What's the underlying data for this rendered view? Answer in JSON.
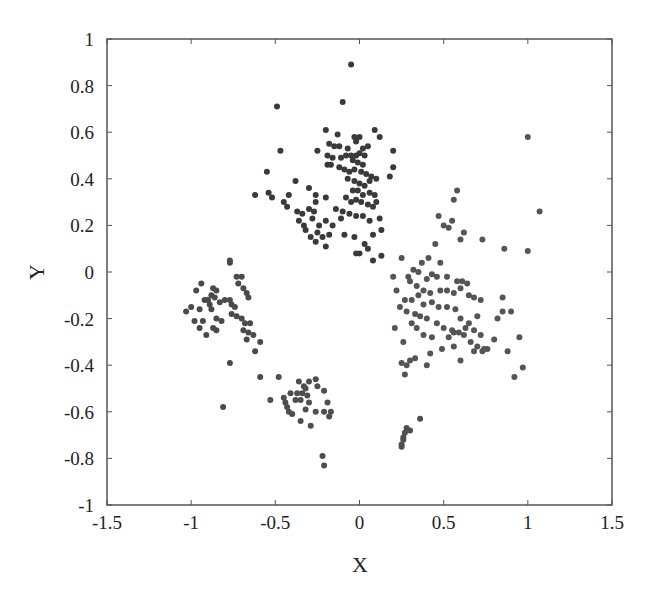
{
  "chart_data": {
    "type": "scatter",
    "title": "",
    "xlabel": "X",
    "ylabel": "Y",
    "xlim": [
      -1.5,
      1.5
    ],
    "ylim": [
      -1,
      1
    ],
    "xticks": [
      -1.5,
      -1,
      -0.5,
      0,
      0.5,
      1,
      1.5
    ],
    "xtick_labels": [
      "-1.5",
      "-1",
      "-0.5",
      "0",
      "0.5",
      "1",
      "1.5"
    ],
    "yticks": [
      -1,
      -0.8,
      -0.6,
      -0.4,
      -0.2,
      0,
      0.2,
      0.4,
      0.6,
      0.8,
      1
    ],
    "ytick_labels": [
      "-1",
      "-0.8",
      "-0.6",
      "-0.4",
      "-0.2",
      "0",
      "0.2",
      "0.4",
      "0.6",
      "0.8",
      "1"
    ],
    "grid": false,
    "legend": null,
    "marker_color": "#444444",
    "marker_color_light": "#5a5a5a",
    "marker_radius": 3,
    "series": [
      {
        "name": "cluster-top",
        "color": "#3a3a3a",
        "points": [
          [
            -0.05,
            0.89
          ],
          [
            -0.1,
            0.73
          ],
          [
            -0.49,
            0.71
          ],
          [
            -0.2,
            0.61
          ],
          [
            -0.13,
            0.59
          ],
          [
            -0.03,
            0.58
          ],
          [
            0.0,
            0.58
          ],
          [
            -0.02,
            0.56
          ],
          [
            0.09,
            0.61
          ],
          [
            0.12,
            0.58
          ],
          [
            -0.47,
            0.52
          ],
          [
            -0.25,
            0.52
          ],
          [
            0.02,
            0.53
          ],
          [
            0.05,
            0.54
          ],
          [
            -0.18,
            0.55
          ],
          [
            -0.15,
            0.54
          ],
          [
            -0.12,
            0.54
          ],
          [
            -0.07,
            0.53
          ],
          [
            -0.19,
            0.5
          ],
          [
            -0.16,
            0.49
          ],
          [
            -0.11,
            0.49
          ],
          [
            -0.08,
            0.5
          ],
          [
            -0.05,
            0.5
          ],
          [
            -0.02,
            0.5
          ],
          [
            0.0,
            0.51
          ],
          [
            0.03,
            0.5
          ],
          [
            -0.04,
            0.48
          ],
          [
            -0.01,
            0.47
          ],
          [
            0.02,
            0.46
          ],
          [
            -0.19,
            0.46
          ],
          [
            -0.17,
            0.46
          ],
          [
            -0.12,
            0.45
          ],
          [
            -0.09,
            0.44
          ],
          [
            -0.06,
            0.43
          ],
          [
            -0.03,
            0.44
          ],
          [
            0.01,
            0.43
          ],
          [
            0.04,
            0.42
          ],
          [
            0.07,
            0.41
          ],
          [
            -0.07,
            0.4
          ],
          [
            -0.03,
            0.39
          ],
          [
            0.0,
            0.38
          ],
          [
            0.03,
            0.37
          ],
          [
            0.06,
            0.39
          ],
          [
            0.1,
            0.4
          ],
          [
            -0.55,
            0.43
          ],
          [
            -0.38,
            0.39
          ],
          [
            -0.3,
            0.36
          ],
          [
            -0.04,
            0.35
          ],
          [
            -0.01,
            0.35
          ],
          [
            0.02,
            0.33
          ],
          [
            0.06,
            0.34
          ],
          [
            0.09,
            0.33
          ],
          [
            -0.08,
            0.32
          ],
          [
            -0.05,
            0.3
          ],
          [
            -0.02,
            0.31
          ],
          [
            0.01,
            0.3
          ],
          [
            0.05,
            0.29
          ],
          [
            0.08,
            0.28
          ],
          [
            -0.2,
            0.32
          ],
          [
            -0.26,
            0.33
          ],
          [
            0.1,
            0.3
          ],
          [
            -0.14,
            0.27
          ],
          [
            -0.1,
            0.26
          ],
          [
            -0.06,
            0.25
          ],
          [
            -0.02,
            0.24
          ],
          [
            0.02,
            0.24
          ],
          [
            0.06,
            0.22
          ],
          [
            -0.62,
            0.33
          ],
          [
            -0.54,
            0.34
          ],
          [
            -0.52,
            0.32
          ],
          [
            -0.45,
            0.3
          ],
          [
            -0.43,
            0.28
          ],
          [
            -0.37,
            0.26
          ],
          [
            -0.34,
            0.25
          ],
          [
            -0.3,
            0.27
          ],
          [
            -0.26,
            0.3
          ],
          [
            -0.27,
            0.26
          ],
          [
            -0.42,
            0.33
          ],
          [
            -0.36,
            0.22
          ],
          [
            -0.33,
            0.2
          ],
          [
            -0.28,
            0.23
          ],
          [
            -0.24,
            0.2
          ],
          [
            -0.2,
            0.22
          ],
          [
            -0.16,
            0.2
          ],
          [
            -0.32,
            0.18
          ],
          [
            -0.29,
            0.15
          ],
          [
            -0.25,
            0.17
          ],
          [
            -0.22,
            0.15
          ],
          [
            -0.18,
            0.16
          ],
          [
            -0.26,
            0.13
          ],
          [
            -0.2,
            0.11
          ],
          [
            -0.09,
            0.16
          ],
          [
            -0.03,
            0.15
          ],
          [
            0.03,
            0.12
          ],
          [
            0.0,
            0.08
          ],
          [
            0.08,
            0.16
          ],
          [
            -0.11,
            0.23
          ],
          [
            0.12,
            0.23
          ],
          [
            0.13,
            0.18
          ],
          [
            0.2,
            0.52
          ],
          [
            0.2,
            0.45
          ],
          [
            0.18,
            0.41
          ],
          [
            -0.02,
            0.08
          ],
          [
            0.05,
            0.1
          ],
          [
            0.08,
            0.05
          ],
          [
            0.13,
            0.07
          ]
        ]
      },
      {
        "name": "cluster-right",
        "color": "#555555",
        "points": [
          [
            1.0,
            0.58
          ],
          [
            1.07,
            0.26
          ],
          [
            0.58,
            0.35
          ],
          [
            0.56,
            0.31
          ],
          [
            0.47,
            0.24
          ],
          [
            0.55,
            0.22
          ],
          [
            0.5,
            0.2
          ],
          [
            0.53,
            0.19
          ],
          [
            0.62,
            0.17
          ],
          [
            0.6,
            0.14
          ],
          [
            0.73,
            0.14
          ],
          [
            0.86,
            0.1
          ],
          [
            1.0,
            0.09
          ],
          [
            0.45,
            0.12
          ],
          [
            0.41,
            0.06
          ],
          [
            0.25,
            0.06
          ],
          [
            0.37,
            0.04
          ],
          [
            0.48,
            0.04
          ],
          [
            0.2,
            -0.02
          ],
          [
            0.35,
            0.0
          ],
          [
            0.29,
            -0.02
          ],
          [
            0.4,
            -0.03
          ],
          [
            0.43,
            -0.01
          ],
          [
            0.46,
            -0.02
          ],
          [
            0.52,
            -0.02
          ],
          [
            0.58,
            -0.04
          ],
          [
            0.61,
            -0.04
          ],
          [
            0.64,
            -0.05
          ],
          [
            0.3,
            -0.04
          ],
          [
            0.34,
            -0.06
          ],
          [
            0.38,
            -0.08
          ],
          [
            0.42,
            -0.09
          ],
          [
            0.48,
            -0.08
          ],
          [
            0.52,
            -0.08
          ],
          [
            0.56,
            -0.09
          ],
          [
            0.6,
            -0.07
          ],
          [
            0.65,
            -0.1
          ],
          [
            0.68,
            -0.11
          ],
          [
            0.72,
            -0.12
          ],
          [
            0.85,
            -0.11
          ],
          [
            0.9,
            -0.17
          ],
          [
            0.27,
            -0.12
          ],
          [
            0.31,
            -0.12
          ],
          [
            0.35,
            -0.1
          ],
          [
            0.38,
            -0.14
          ],
          [
            0.43,
            -0.13
          ],
          [
            0.47,
            -0.15
          ],
          [
            0.52,
            -0.15
          ],
          [
            0.57,
            -0.16
          ],
          [
            0.6,
            -0.2
          ],
          [
            0.65,
            -0.22
          ],
          [
            0.7,
            -0.19
          ],
          [
            0.82,
            -0.2
          ],
          [
            0.85,
            -0.17
          ],
          [
            0.28,
            -0.17
          ],
          [
            0.33,
            -0.18
          ],
          [
            0.36,
            -0.19
          ],
          [
            0.4,
            -0.2
          ],
          [
            0.46,
            -0.22
          ],
          [
            0.5,
            -0.24
          ],
          [
            0.55,
            -0.25
          ],
          [
            0.59,
            -0.26
          ],
          [
            0.63,
            -0.24
          ],
          [
            0.68,
            -0.25
          ],
          [
            0.72,
            -0.27
          ],
          [
            0.8,
            -0.29
          ],
          [
            0.31,
            -0.22
          ],
          [
            0.34,
            -0.24
          ],
          [
            0.38,
            -0.27
          ],
          [
            0.43,
            -0.28
          ],
          [
            0.53,
            -0.28
          ],
          [
            0.56,
            -0.26
          ],
          [
            0.62,
            -0.27
          ],
          [
            0.66,
            -0.3
          ],
          [
            0.7,
            -0.32
          ],
          [
            0.74,
            -0.33
          ],
          [
            0.88,
            -0.34
          ],
          [
            0.95,
            -0.28
          ],
          [
            0.3,
            -0.38
          ],
          [
            0.33,
            -0.37
          ],
          [
            0.42,
            -0.35
          ],
          [
            0.49,
            -0.33
          ],
          [
            0.56,
            -0.32
          ],
          [
            0.68,
            -0.34
          ],
          [
            0.73,
            -0.34
          ],
          [
            0.76,
            -0.33
          ],
          [
            0.25,
            -0.39
          ],
          [
            0.28,
            -0.4
          ],
          [
            0.27,
            -0.44
          ],
          [
            0.4,
            -0.4
          ],
          [
            0.6,
            -0.38
          ],
          [
            0.97,
            -0.41
          ],
          [
            0.92,
            -0.45
          ],
          [
            0.22,
            -0.08
          ],
          [
            0.24,
            -0.15
          ],
          [
            0.21,
            -0.24
          ],
          [
            0.26,
            -0.3
          ],
          [
            0.32,
            0.01
          ]
        ]
      },
      {
        "name": "cluster-left",
        "color": "#4a4a4a",
        "points": [
          [
            -0.77,
            0.05
          ],
          [
            -0.77,
            0.04
          ],
          [
            -0.73,
            -0.02
          ],
          [
            -0.7,
            -0.02
          ],
          [
            -0.94,
            -0.05
          ],
          [
            -0.97,
            -0.08
          ],
          [
            -0.87,
            -0.07
          ],
          [
            -0.85,
            -0.08
          ],
          [
            -0.88,
            -0.1
          ],
          [
            -0.72,
            -0.05
          ],
          [
            -0.69,
            -0.07
          ],
          [
            -0.67,
            -0.09
          ],
          [
            -0.66,
            -0.11
          ],
          [
            -0.9,
            -0.12
          ],
          [
            -0.92,
            -0.12
          ],
          [
            -0.89,
            -0.14
          ],
          [
            -0.86,
            -0.11
          ],
          [
            -0.83,
            -0.13
          ],
          [
            -0.8,
            -0.12
          ],
          [
            -0.77,
            -0.12
          ],
          [
            -1.0,
            -0.15
          ],
          [
            -0.95,
            -0.16
          ],
          [
            -0.88,
            -0.16
          ],
          [
            -0.76,
            -0.14
          ],
          [
            -0.74,
            -0.15
          ],
          [
            -1.03,
            -0.17
          ],
          [
            -0.76,
            -0.18
          ],
          [
            -0.73,
            -0.19
          ],
          [
            -0.7,
            -0.2
          ],
          [
            -0.98,
            -0.21
          ],
          [
            -0.93,
            -0.21
          ],
          [
            -0.85,
            -0.2
          ],
          [
            -0.82,
            -0.21
          ],
          [
            -0.68,
            -0.22
          ],
          [
            -0.65,
            -0.22
          ],
          [
            -0.95,
            -0.24
          ],
          [
            -0.87,
            -0.24
          ],
          [
            -0.85,
            -0.25
          ],
          [
            -0.69,
            -0.25
          ],
          [
            -0.66,
            -0.26
          ],
          [
            -0.63,
            -0.27
          ],
          [
            -0.91,
            -0.27
          ],
          [
            -0.67,
            -0.29
          ],
          [
            -0.59,
            -0.3
          ],
          [
            -0.62,
            -0.34
          ],
          [
            -0.77,
            -0.39
          ],
          [
            -0.59,
            -0.45
          ],
          [
            -0.81,
            -0.58
          ]
        ]
      },
      {
        "name": "cluster-bottom",
        "color": "#4e4e4e",
        "points": [
          [
            -0.48,
            -0.45
          ],
          [
            -0.36,
            -0.47
          ],
          [
            -0.3,
            -0.47
          ],
          [
            -0.26,
            -0.46
          ],
          [
            -0.33,
            -0.49
          ],
          [
            -0.32,
            -0.5
          ],
          [
            -0.25,
            -0.49
          ],
          [
            -0.41,
            -0.52
          ],
          [
            -0.37,
            -0.52
          ],
          [
            -0.34,
            -0.52
          ],
          [
            -0.31,
            -0.53
          ],
          [
            -0.21,
            -0.51
          ],
          [
            -0.53,
            -0.55
          ],
          [
            -0.45,
            -0.54
          ],
          [
            -0.44,
            -0.56
          ],
          [
            -0.38,
            -0.55
          ],
          [
            -0.35,
            -0.55
          ],
          [
            -0.3,
            -0.56
          ],
          [
            -0.19,
            -0.56
          ],
          [
            -0.43,
            -0.58
          ],
          [
            -0.42,
            -0.6
          ],
          [
            -0.32,
            -0.59
          ],
          [
            -0.26,
            -0.6
          ],
          [
            -0.21,
            -0.6
          ],
          [
            -0.17,
            -0.6
          ],
          [
            -0.4,
            -0.61
          ],
          [
            -0.18,
            -0.62
          ],
          [
            -0.29,
            -0.66
          ],
          [
            -0.35,
            -0.64
          ],
          [
            -0.22,
            -0.79
          ],
          [
            -0.21,
            -0.83
          ],
          [
            0.28,
            -0.67
          ],
          [
            0.3,
            -0.68
          ],
          [
            0.27,
            -0.69
          ],
          [
            0.26,
            -0.71
          ],
          [
            0.26,
            -0.72
          ],
          [
            0.25,
            -0.74
          ],
          [
            0.25,
            -0.75
          ],
          [
            0.36,
            -0.63
          ]
        ]
      }
    ]
  }
}
